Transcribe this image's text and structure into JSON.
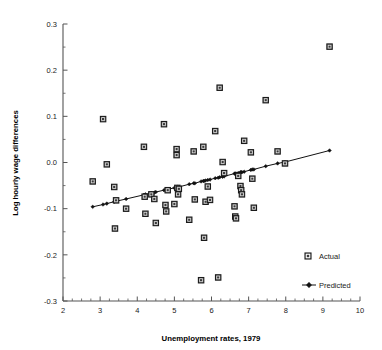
{
  "chart_data": {
    "type": "scatter",
    "title": "",
    "xlabel": "Unemployment rates, 1979",
    "ylabel": "Log hourly wage differences",
    "xlim": [
      2,
      10
    ],
    "ylim": [
      -0.3,
      0.3
    ],
    "x_major_ticks": [
      2,
      3,
      4,
      5,
      6,
      7,
      8,
      9,
      10
    ],
    "x_tick_labels": [
      "2",
      "3",
      "4",
      "5",
      "6",
      "7",
      "8",
      "9",
      "10"
    ],
    "x_minor_step": 0.25,
    "y_major_ticks": [
      -0.3,
      -0.2,
      -0.1,
      0.0,
      0.1,
      0.2,
      0.3
    ],
    "y_tick_labels": [
      "-0.3",
      "-0.2",
      "-0.1",
      "0.0",
      "0.1",
      "0.2",
      "0.3"
    ],
    "y_minor_step": 0.05,
    "grid": false,
    "legend_position": "bottom-right",
    "series": [
      {
        "name": "Actual",
        "marker": "square",
        "type": "scatter",
        "points": [
          [
            2.8,
            -0.041
          ],
          [
            3.08,
            0.094
          ],
          [
            3.18,
            -0.004
          ],
          [
            3.38,
            -0.053
          ],
          [
            3.4,
            -0.143
          ],
          [
            3.43,
            -0.082
          ],
          [
            3.7,
            -0.1
          ],
          [
            4.18,
            0.034
          ],
          [
            4.2,
            -0.074
          ],
          [
            4.22,
            -0.111
          ],
          [
            4.38,
            -0.069
          ],
          [
            4.46,
            -0.079
          ],
          [
            4.5,
            -0.131
          ],
          [
            4.72,
            0.083
          ],
          [
            4.76,
            -0.092
          ],
          [
            4.78,
            -0.106
          ],
          [
            4.82,
            -0.06
          ],
          [
            5.0,
            -0.09
          ],
          [
            5.06,
            0.029
          ],
          [
            5.06,
            0.016
          ],
          [
            5.08,
            -0.055
          ],
          [
            5.1,
            -0.069
          ],
          [
            5.12,
            -0.057
          ],
          [
            5.4,
            -0.124
          ],
          [
            5.52,
            0.024
          ],
          [
            5.55,
            -0.08
          ],
          [
            5.72,
            -0.255
          ],
          [
            5.78,
            0.034
          ],
          [
            5.8,
            -0.163
          ],
          [
            5.84,
            -0.085
          ],
          [
            5.9,
            -0.052
          ],
          [
            5.96,
            -0.081
          ],
          [
            6.1,
            0.068
          ],
          [
            6.18,
            -0.249
          ],
          [
            6.22,
            0.162
          ],
          [
            6.3,
            0.001
          ],
          [
            6.34,
            -0.023
          ],
          [
            6.62,
            -0.095
          ],
          [
            6.64,
            -0.117
          ],
          [
            6.66,
            -0.121
          ],
          [
            6.72,
            -0.029
          ],
          [
            6.78,
            -0.051
          ],
          [
            6.8,
            -0.06
          ],
          [
            6.82,
            -0.069
          ],
          [
            6.88,
            0.047
          ],
          [
            7.06,
            0.022
          ],
          [
            7.1,
            -0.035
          ],
          [
            7.14,
            -0.098
          ],
          [
            7.46,
            0.135
          ],
          [
            7.78,
            0.024
          ],
          [
            7.98,
            -0.002
          ],
          [
            9.18,
            0.251
          ]
        ]
      },
      {
        "name": "Predicted",
        "marker": "diamond",
        "type": "line",
        "points": [
          [
            2.8,
            -0.096
          ],
          [
            3.08,
            -0.091
          ],
          [
            3.18,
            -0.089
          ],
          [
            3.38,
            -0.085
          ],
          [
            3.4,
            -0.084
          ],
          [
            3.43,
            -0.084
          ],
          [
            3.7,
            -0.079
          ],
          [
            4.18,
            -0.07
          ],
          [
            4.2,
            -0.07
          ],
          [
            4.22,
            -0.069
          ],
          [
            4.38,
            -0.066
          ],
          [
            4.46,
            -0.065
          ],
          [
            4.5,
            -0.064
          ],
          [
            4.72,
            -0.06
          ],
          [
            4.76,
            -0.059
          ],
          [
            4.78,
            -0.059
          ],
          [
            4.82,
            -0.058
          ],
          [
            5.0,
            -0.055
          ],
          [
            5.06,
            -0.054
          ],
          [
            5.08,
            -0.053
          ],
          [
            5.1,
            -0.053
          ],
          [
            5.12,
            -0.053
          ],
          [
            5.4,
            -0.047
          ],
          [
            5.52,
            -0.045
          ],
          [
            5.55,
            -0.045
          ],
          [
            5.72,
            -0.041
          ],
          [
            5.78,
            -0.04
          ],
          [
            5.8,
            -0.04
          ],
          [
            5.84,
            -0.039
          ],
          [
            5.9,
            -0.038
          ],
          [
            5.96,
            -0.037
          ],
          [
            6.1,
            -0.034
          ],
          [
            6.18,
            -0.033
          ],
          [
            6.22,
            -0.032
          ],
          [
            6.3,
            -0.031
          ],
          [
            6.34,
            -0.03
          ],
          [
            6.62,
            -0.024
          ],
          [
            6.64,
            -0.024
          ],
          [
            6.66,
            -0.024
          ],
          [
            6.72,
            -0.023
          ],
          [
            6.78,
            -0.021
          ],
          [
            6.8,
            -0.021
          ],
          [
            6.82,
            -0.021
          ],
          [
            6.88,
            -0.02
          ],
          [
            7.06,
            -0.016
          ],
          [
            7.1,
            -0.015
          ],
          [
            7.14,
            -0.015
          ],
          [
            7.46,
            -0.008
          ],
          [
            7.78,
            -0.002
          ],
          [
            7.98,
            0.001
          ],
          [
            9.18,
            0.026
          ]
        ]
      }
    ],
    "legend": [
      {
        "label": "Actual",
        "marker": "square"
      },
      {
        "label": "Predicted",
        "marker": "line-diamond"
      }
    ]
  }
}
